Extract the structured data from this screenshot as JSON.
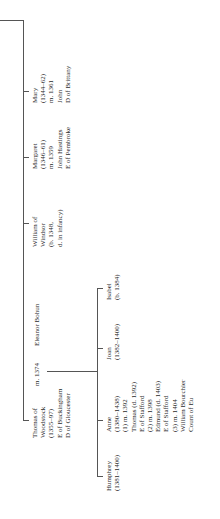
{
  "diagram": {
    "type": "genealogy",
    "orientation": "rotated-90-ccw",
    "generation1": [
      {
        "id": "thomas",
        "lines": [
          "Thomas of",
          "Woodstock",
          "(1355–97)",
          "E of Buckingham",
          "D of Gloucester"
        ]
      },
      {
        "id": "marriage",
        "lines": [
          "m. 1374"
        ]
      },
      {
        "id": "eleanor",
        "lines": [
          "Eleanor Bohun"
        ]
      },
      {
        "id": "william",
        "lines": [
          "William of",
          "Windsor",
          "(b. 1348,",
          "d. in infancy)"
        ]
      },
      {
        "id": "margaret",
        "lines": [
          "Margaret",
          "(1346–61)",
          "m. 1359",
          "John Hastings",
          "E of Pembroke"
        ]
      },
      {
        "id": "mary",
        "lines": [
          "Mary",
          "(1344–62)",
          "m. 1361",
          "John",
          "D of Brittany"
        ]
      }
    ],
    "generation2": [
      {
        "id": "humphrey",
        "lines": [
          "Humphrey",
          "(1381–1400)"
        ]
      },
      {
        "id": "anne",
        "lines": [
          "Anne",
          "(1380–1438)",
          "(1) m. 1392",
          "Thomas (d. 1392)",
          "E of Stafford",
          "(2) m. 1398",
          "Edmund (d. 1403)",
          "E of Stafford",
          "(3) m. 1404",
          "William Bourchier",
          "Count of Eu"
        ]
      },
      {
        "id": "joan",
        "lines": [
          "Joan",
          "(1382–1400)"
        ]
      },
      {
        "id": "isabel",
        "lines": [
          "Isabel",
          "(b. 1384)"
        ]
      }
    ]
  }
}
